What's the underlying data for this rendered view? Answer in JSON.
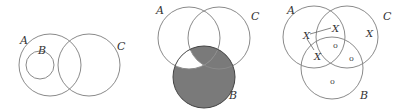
{
  "diagrams": [
    {
      "id": "venn-subset",
      "description": "B is a subset of A; A and C overlap",
      "labels": {
        "A": "A",
        "B": "B",
        "C": "C"
      }
    },
    {
      "id": "venn-shaded",
      "description": "Three overlapping circles; region B shaded except part of B inside A and outside C",
      "labels": {
        "A": "A",
        "B": "B",
        "C": "C"
      },
      "shade_color": "#7a7a7a"
    },
    {
      "id": "venn-marked",
      "description": "Three overlapping circles with X and o marks",
      "labels": {
        "A": "A",
        "B": "B",
        "C": "C"
      },
      "marks": {
        "x_a_only": "X",
        "x_a_c": "X",
        "x_a_b": "X",
        "x_c_only": "X",
        "o_abc": "o",
        "o_bc": "o",
        "o_b_only": "o"
      }
    }
  ]
}
